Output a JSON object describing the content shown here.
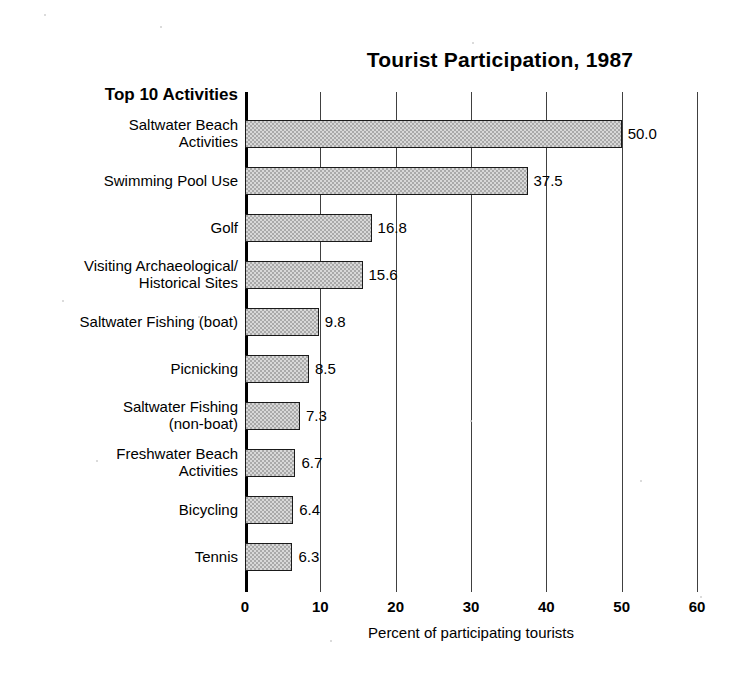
{
  "chart_data": {
    "type": "bar",
    "orientation": "horizontal",
    "title": "Tourist Participation, 1987",
    "category_header": "Top 10 Activities",
    "xlabel": "Percent of participating tourists",
    "ylabel": "",
    "xlim": [
      0,
      60
    ],
    "xticks": [
      0,
      10,
      20,
      30,
      40,
      50,
      60
    ],
    "xtick_labels": [
      "0",
      "10",
      "20",
      "30",
      "40",
      "50",
      "60"
    ],
    "grid": true,
    "grid_axis": "x",
    "legend": false,
    "bar_color": "#a9a9a9",
    "bar_edge_color": "#1a1a1a",
    "categories": [
      "Saltwater Beach\nActivities",
      "Swimming Pool Use",
      "Golf",
      "Visiting Archaeological/\nHistorical Sites",
      "Saltwater Fishing (boat)",
      "Picnicking",
      "Saltwater Fishing\n(non-boat)",
      "Freshwater Beach\nActivities",
      "Bicycling",
      "Tennis"
    ],
    "values": [
      50.0,
      37.5,
      16.8,
      15.6,
      9.8,
      8.5,
      7.3,
      6.7,
      6.4,
      6.3
    ],
    "value_labels": [
      "50.0",
      "37.5",
      "16.8",
      "15.6",
      "9.8",
      "8.5",
      "7.3",
      "6.7",
      "6.4",
      "6.3"
    ]
  }
}
